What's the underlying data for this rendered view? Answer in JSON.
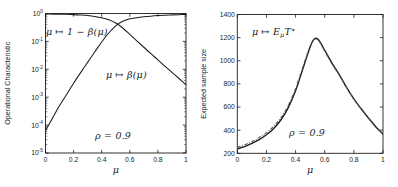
{
  "figure": {
    "background": "#ffffff",
    "line_color": "#1c1c1c",
    "dashed_color": "#585858",
    "text_color": "#1c1c1c"
  },
  "chart_data": [
    {
      "type": "line",
      "panel": "left",
      "title": "",
      "xlabel": "μ",
      "ylabel": "Operational Characteristic",
      "y_scale": "log",
      "xlim": [
        0,
        1
      ],
      "ylim": [
        1e-05,
        1
      ],
      "x_tick_values": [
        0,
        0.2,
        0.4,
        0.6,
        0.8,
        1
      ],
      "x_tick_labels": [
        "0",
        "0.2",
        "0.4",
        "0.6",
        "0.8",
        "1"
      ],
      "y_tick_exponents": [
        "0",
        "-1",
        "-2",
        "-3",
        "-4",
        "-5"
      ],
      "grid": false,
      "series": [
        {
          "id": "power-curve",
          "name": "μ ↦ 1 − β(μ)",
          "style": "solid",
          "x": [
            0,
            0.05,
            0.1,
            0.15,
            0.2,
            0.25,
            0.3,
            0.35,
            0.4,
            0.45,
            0.5,
            0.55,
            0.6,
            0.65,
            0.7,
            0.75,
            0.8,
            0.85,
            0.9,
            0.95,
            1
          ],
          "log10_y": [
            -4.2,
            -3.75,
            -3.3,
            -2.9,
            -2.5,
            -2.12,
            -1.75,
            -1.38,
            -1.02,
            -0.7,
            -0.44,
            -0.28,
            -0.19,
            -0.15,
            -0.12,
            -0.095,
            -0.075,
            -0.06,
            -0.05,
            -0.042,
            -0.035
          ]
        },
        {
          "id": "beta-curve",
          "name": "μ ↦ β(μ)",
          "style": "solid",
          "x": [
            0,
            0.05,
            0.1,
            0.15,
            0.2,
            0.25,
            0.3,
            0.35,
            0.4,
            0.45,
            0.5,
            0.55,
            0.6,
            0.65,
            0.7,
            0.75,
            0.8,
            0.85,
            0.9,
            0.95,
            1
          ],
          "log10_y": [
            -0.02,
            -0.022,
            -0.025,
            -0.03,
            -0.04,
            -0.055,
            -0.075,
            -0.105,
            -0.15,
            -0.225,
            -0.34,
            -0.52,
            -0.75,
            -0.98,
            -1.21,
            -1.44,
            -1.66,
            -1.89,
            -2.11,
            -2.33,
            -2.55
          ]
        }
      ],
      "annotations": [
        {
          "text": "μ ↦ 1 − β(μ)",
          "left": 46,
          "top": 27
        },
        {
          "text": "μ ↦ β(μ)",
          "left": 106,
          "top": 70
        },
        {
          "text": "ρ = 0.9",
          "left": 95,
          "top": 131
        }
      ]
    },
    {
      "type": "line",
      "panel": "right",
      "title": "",
      "xlabel": "μ",
      "ylabel": "Expected sample size",
      "y_scale": "linear",
      "xlim": [
        0,
        1
      ],
      "ylim": [
        200,
        1400
      ],
      "x_tick_values": [
        0,
        0.2,
        0.4,
        0.6,
        0.8,
        1
      ],
      "x_tick_labels": [
        "0",
        "0.2",
        "0.4",
        "0.6",
        "0.8",
        "1"
      ],
      "y_tick_values": [
        200,
        400,
        600,
        800,
        1000,
        1200,
        1400
      ],
      "grid": false,
      "series": [
        {
          "id": "expected-sample-size-curve",
          "name": "μ ↦ E_{μ}T^{∗}",
          "style": "solid",
          "x": [
            0,
            0.05,
            0.1,
            0.15,
            0.2,
            0.25,
            0.3,
            0.35,
            0.4,
            0.45,
            0.5,
            0.53,
            0.56,
            0.6,
            0.65,
            0.7,
            0.75,
            0.8,
            0.85,
            0.9,
            0.95,
            1
          ],
          "y": [
            238,
            258,
            285,
            318,
            360,
            415,
            490,
            595,
            740,
            930,
            1120,
            1190,
            1178,
            1090,
            980,
            880,
            770,
            670,
            585,
            505,
            430,
            365
          ]
        },
        {
          "id": "expected-sample-size-approx-curve",
          "name": "dash-dot approximation",
          "style": "dashdot",
          "x": [
            0,
            0.05,
            0.1,
            0.15,
            0.2,
            0.25,
            0.3,
            0.35,
            0.4,
            0.45,
            0.5,
            0.53,
            0.56,
            0.6,
            0.65,
            0.7,
            0.75,
            0.8,
            0.85,
            0.9,
            0.95,
            1
          ],
          "y": [
            252,
            274,
            302,
            336,
            378,
            434,
            510,
            616,
            760,
            948,
            1128,
            1185,
            1170,
            1082,
            972,
            874,
            766,
            668,
            584,
            506,
            434,
            372
          ]
        }
      ],
      "annotations": [
        {
          "text": "μ ↦ E_{μ}T^{∗}",
          "left": 252,
          "top": 27
        },
        {
          "text": "ρ = 0.9",
          "left": 289,
          "top": 128
        }
      ]
    }
  ]
}
